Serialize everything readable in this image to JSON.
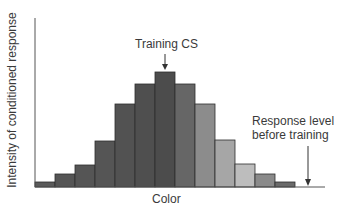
{
  "chart_data": {
    "type": "bar",
    "title": "",
    "xlabel": "Color",
    "ylabel": "Intensity of conditioned response",
    "categories": [
      "c1",
      "c2",
      "c3",
      "c4",
      "c5",
      "c6",
      "c7",
      "c8",
      "c9",
      "c10",
      "c11",
      "c12",
      "c13"
    ],
    "values": [
      5,
      13,
      22,
      46,
      83,
      103,
      115,
      103,
      83,
      47,
      23,
      13,
      5
    ],
    "colors": [
      "#5a5a5a",
      "#555555",
      "#555555",
      "#555555",
      "#525252",
      "#4f4f4f",
      "#4c4c4c",
      "#666666",
      "#8c8c8c",
      "#a6a6a6",
      "#bdbdbd",
      "#8a8a8a",
      "#6a6a6a"
    ],
    "annotations": [
      {
        "text": "Training CS",
        "target_index": 6
      },
      {
        "text": "Response level before training",
        "lines": [
          "Response level",
          "before training"
        ]
      }
    ],
    "ylim": [
      0,
      120
    ],
    "grid": false,
    "legend": null
  },
  "labels": {
    "xlabel": "Color",
    "ylabel": "Intensity of conditioned response",
    "training_cs": "Training CS",
    "before_line1": "Response level",
    "before_line2": "before training"
  }
}
